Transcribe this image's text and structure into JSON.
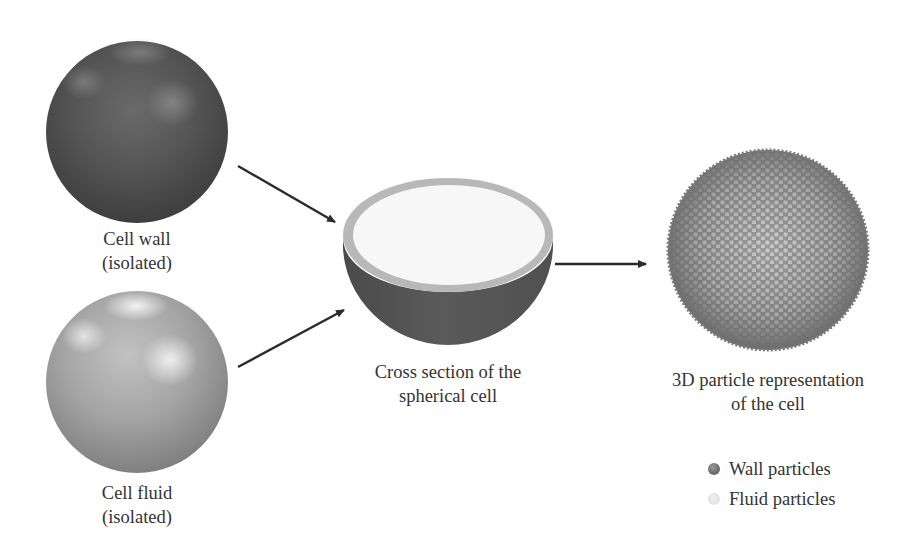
{
  "figure": {
    "type": "process-diagram",
    "nodes": [
      {
        "id": "cell-wall",
        "label_lines": [
          "Cell wall",
          "(isolated)"
        ],
        "shape": "sphere",
        "shade": "dark"
      },
      {
        "id": "cell-fluid",
        "label_lines": [
          "Cell fluid",
          "(isolated)"
        ],
        "shape": "sphere",
        "shade": "light"
      },
      {
        "id": "cross-section",
        "label_lines": [
          "Cross section of the",
          "spherical cell"
        ],
        "shape": "hemisphere"
      },
      {
        "id": "particle-model",
        "label_lines": [
          "3D particle representation",
          "of the cell"
        ],
        "shape": "particle-sphere"
      }
    ],
    "edges": [
      {
        "from": "cell-wall",
        "to": "cross-section"
      },
      {
        "from": "cell-fluid",
        "to": "cross-section"
      },
      {
        "from": "cross-section",
        "to": "particle-model"
      }
    ]
  },
  "labels": {
    "cell_wall": {
      "line1": "Cell wall",
      "line2": "(isolated)"
    },
    "cell_fluid": {
      "line1": "Cell fluid",
      "line2": "(isolated)"
    },
    "cross_section": {
      "line1": "Cross section of the",
      "line2": "spherical cell"
    },
    "particle_model": {
      "line1": "3D particle representation",
      "line2": "of the cell"
    }
  },
  "legend": {
    "items": [
      {
        "label": "Wall particles",
        "color": "#707070"
      },
      {
        "label": "Fluid particles",
        "color": "#e8e8e8"
      }
    ]
  },
  "colors": {
    "wall_dark": "#4a4a4a",
    "wall_mid": "#5c5c5c",
    "fluid_mid": "#9c9c9c",
    "fluid_light": "#d6d6d6",
    "rim": "#b8b8b8",
    "interior": "#f7f7f7",
    "particle_gray": "#7a7a7a",
    "arrow": "#2b2b2b"
  }
}
